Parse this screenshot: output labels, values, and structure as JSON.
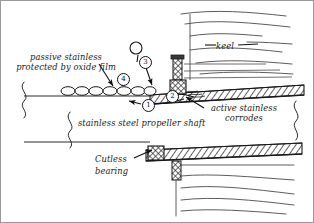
{
  "figure": {
    "width": 314,
    "height": 223,
    "background_color": "#ffffff",
    "ink_color": "#1a1a1a",
    "border_color": "#888888"
  },
  "labels": {
    "passive": "passive stainless protected by oxide film",
    "keel": "keel",
    "active": "active stainless corrodes",
    "shaft": "stainless steel propeller shaft",
    "cutless": "Cutless bearing"
  },
  "callouts": [
    {
      "id": "callout-1",
      "number": "1",
      "x": 142,
      "y": 99
    },
    {
      "id": "callout-2",
      "number": "2",
      "x": 166,
      "y": 90
    },
    {
      "id": "callout-3",
      "number": "3",
      "x": 139,
      "y": 56
    },
    {
      "id": "callout-4",
      "number": "4",
      "x": 117,
      "y": 73
    }
  ],
  "parts": {
    "upper_hatched_band": "hull-skin-upper-hatched",
    "lower_hatched_band": "hull-skin-lower-hatched",
    "bearing_block": "cutless-bearing-block",
    "stud": "vertical-stud",
    "oxide_bubbles": "oxide-film-bubbles",
    "open_bubble": "detached-oxide-bubble",
    "break_line_left": "shaft-break-line-left",
    "break_line_right": "shaft-break-line-right"
  }
}
